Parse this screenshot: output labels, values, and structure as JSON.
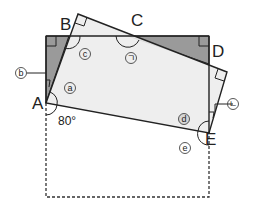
{
  "diagram": {
    "type": "geometry",
    "vertices": {
      "A": "A",
      "B": "B",
      "C": "C",
      "D": "D",
      "E": "E"
    },
    "angle_given": "80°",
    "angle_marks": {
      "a": "a",
      "b": "b",
      "c": "c",
      "d": "d",
      "e": "e",
      "giyeok": "ㄱ",
      "nieun": "ㄴ"
    },
    "colors": {
      "shaded": "#9a9a9a",
      "paper": "#ededed",
      "line": "#222222"
    }
  }
}
